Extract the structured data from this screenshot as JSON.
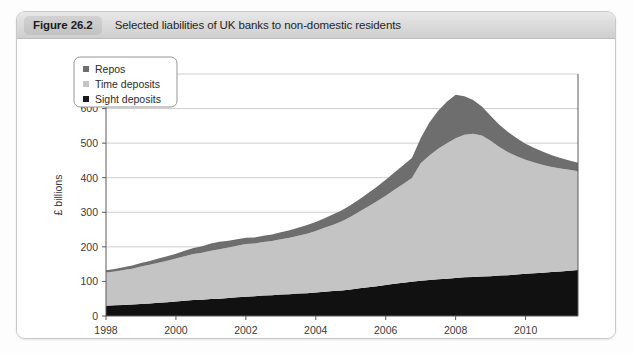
{
  "figure": {
    "badge": "Figure 26.2",
    "title": "Selected liabilities of UK banks to non-domestic residents"
  },
  "legend": {
    "position": "top-left-inside",
    "items": [
      {
        "label": "Repos",
        "color": "#6e6e6e",
        "marker": "square-marker"
      },
      {
        "label": "Time deposits",
        "color": "#c4c4c4",
        "marker": "square-marker"
      },
      {
        "label": "Sight deposits",
        "color": "#1a1a1a",
        "marker": "square-marker"
      }
    ]
  },
  "colors": {
    "repos": "#6e6e6e",
    "time_deposits": "#c4c4c4",
    "sight_deposits": "#111111",
    "axis": "#5a5a5a",
    "grid": "#b9b9b9",
    "card_border": "#c9c9c9",
    "header_bg": "#dcdcdc",
    "badge_bg": "#c8c8c8"
  },
  "chart_data": {
    "type": "area",
    "stacked": true,
    "title": "Selected liabilities of UK banks to non-domestic residents",
    "xlabel": "",
    "ylabel": "£ billions",
    "ylim": [
      0,
      700
    ],
    "xlim": [
      1998.0,
      2011.5
    ],
    "ytick_step": 100,
    "yticks": [
      0,
      100,
      200,
      300,
      400,
      500,
      600,
      700
    ],
    "xticks": [
      1998,
      2000,
      2002,
      2004,
      2006,
      2008,
      2010
    ],
    "xtick_labels": [
      "1998",
      "2000",
      "2002",
      "2004",
      "2006",
      "2008",
      "2010"
    ],
    "grid": "horizontal",
    "legend_entries": [
      "Repos",
      "Time deposits",
      "Sight deposits"
    ],
    "stack_order_bottom_to_top": [
      "Sight deposits",
      "Time deposits",
      "Repos"
    ],
    "x": [
      1998.0,
      1998.25,
      1998.5,
      1998.75,
      1999.0,
      1999.25,
      1999.5,
      1999.75,
      2000.0,
      2000.25,
      2000.5,
      2000.75,
      2001.0,
      2001.25,
      2001.5,
      2001.75,
      2002.0,
      2002.25,
      2002.5,
      2002.75,
      2003.0,
      2003.25,
      2003.5,
      2003.75,
      2004.0,
      2004.25,
      2004.5,
      2004.75,
      2005.0,
      2005.25,
      2005.5,
      2005.75,
      2006.0,
      2006.25,
      2006.5,
      2006.75,
      2007.0,
      2007.25,
      2007.5,
      2007.75,
      2008.0,
      2008.25,
      2008.5,
      2008.75,
      2009.0,
      2009.25,
      2009.5,
      2009.75,
      2010.0,
      2010.25,
      2010.5,
      2010.75,
      2011.0,
      2011.25,
      2011.5
    ],
    "series": [
      {
        "name": "Sight deposits",
        "color": "#111111",
        "values": [
          30,
          31,
          32,
          33,
          35,
          36,
          38,
          40,
          42,
          44,
          46,
          47,
          49,
          50,
          52,
          54,
          56,
          57,
          59,
          60,
          62,
          63,
          65,
          66,
          68,
          70,
          72,
          74,
          77,
          80,
          83,
          86,
          90,
          93,
          96,
          99,
          102,
          104,
          106,
          108,
          110,
          112,
          113,
          114,
          115,
          117,
          118,
          120,
          122,
          124,
          125,
          127,
          129,
          131,
          133
        ]
      },
      {
        "name": "Time deposits",
        "color": "#c4c4c4",
        "values": [
          96,
          98,
          101,
          104,
          108,
          112,
          116,
          120,
          124,
          129,
          133,
          136,
          140,
          143,
          146,
          149,
          152,
          153,
          155,
          157,
          160,
          163,
          167,
          172,
          178,
          185,
          192,
          200,
          210,
          222,
          234,
          246,
          258,
          272,
          286,
          300,
          340,
          360,
          378,
          392,
          404,
          412,
          414,
          408,
          392,
          372,
          356,
          342,
          330,
          320,
          312,
          304,
          298,
          292,
          286
        ]
      },
      {
        "name": "Repos",
        "color": "#6e6e6e",
        "values": [
          6,
          7,
          8,
          9,
          10,
          11,
          12,
          13,
          14,
          16,
          18,
          19,
          21,
          22,
          20,
          19,
          18,
          17,
          18,
          19,
          20,
          22,
          23,
          25,
          26,
          28,
          30,
          32,
          34,
          36,
          39,
          42,
          46,
          50,
          54,
          58,
          72,
          96,
          110,
          120,
          126,
          112,
          98,
          84,
          72,
          64,
          58,
          52,
          46,
          42,
          38,
          34,
          30,
          27,
          24
        ]
      }
    ],
    "totals_note": "Peak total ≈ 635 (2008); start ≈ 132 (1998); end ≈ 443 (2011)"
  }
}
